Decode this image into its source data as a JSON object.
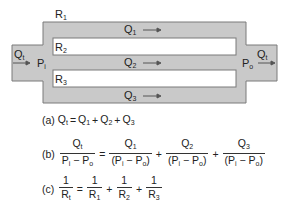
{
  "diagram": {
    "title_resistance": {
      "base": "R",
      "sub": "1"
    },
    "inner_labels": [
      {
        "base": "R",
        "sub": "2"
      },
      {
        "base": "R",
        "sub": "3"
      }
    ],
    "flows": [
      {
        "base": "Q",
        "sub": "1"
      },
      {
        "base": "Q",
        "sub": "2"
      },
      {
        "base": "Q",
        "sub": "3"
      }
    ],
    "inlet_flow": {
      "base": "Q",
      "sub": "t"
    },
    "outlet_flow": {
      "base": "Q",
      "sub": "t"
    },
    "inlet_pressure": {
      "base": "P",
      "sub": "i"
    },
    "outlet_pressure": {
      "base": "P",
      "sub": "o"
    },
    "colors": {
      "fill": "#c9c9c9",
      "stroke": "#7a7a7a",
      "channel": "#ffffff",
      "arrow": "#555555"
    }
  },
  "equations": {
    "a": {
      "label": "(a)",
      "text_lhs": "Q",
      "lhs_sub": "t",
      "terms": [
        {
          "base": "Q",
          "sub": "1"
        },
        {
          "base": "Q",
          "sub": "2"
        },
        {
          "base": "Q",
          "sub": "3"
        }
      ],
      "equals": "=",
      "plus": "+"
    },
    "b": {
      "label": "(b)",
      "lhs": {
        "num": "Qt",
        "den": "Pi − Po"
      },
      "terms": [
        {
          "num": "Q1",
          "den": "(Pi − Po)"
        },
        {
          "num": "Q2",
          "den": "(Pi − Po)"
        },
        {
          "num": "Q3",
          "den": "(Pi − Po)"
        }
      ],
      "equals": "=",
      "plus": "+"
    },
    "c": {
      "label": "(c)",
      "lhs": {
        "num": "1",
        "den_base": "R",
        "den_sub": "t"
      },
      "terms": [
        {
          "num": "1",
          "den_base": "R",
          "den_sub": "1"
        },
        {
          "num": "1",
          "den_base": "R",
          "den_sub": "2"
        },
        {
          "num": "1",
          "den_base": "R",
          "den_sub": "3"
        }
      ],
      "equals": "=",
      "plus": "+"
    }
  }
}
